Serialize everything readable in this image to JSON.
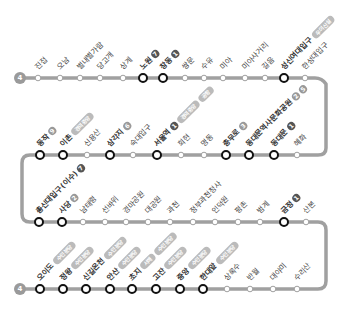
{
  "line": {
    "number": "4",
    "color": "#9a9a9a",
    "track_color": "#a0a0a0"
  },
  "rows": [
    {
      "y": 78,
      "stations": [
        {
          "name": "진접",
          "x": 38,
          "transfer": false
        },
        {
          "name": "오남",
          "x": 60,
          "transfer": false
        },
        {
          "name": "별내별가람",
          "x": 80,
          "transfer": false
        },
        {
          "name": "당고개",
          "x": 100,
          "transfer": false
        },
        {
          "name": "상계",
          "x": 123,
          "transfer": false
        },
        {
          "name": "노원",
          "x": 143,
          "transfer": true,
          "badges": [
            "7"
          ]
        },
        {
          "name": "창동",
          "x": 163,
          "transfer": true,
          "badges": [
            "1"
          ]
        },
        {
          "name": "쌍문",
          "x": 185,
          "transfer": false
        },
        {
          "name": "수유",
          "x": 204,
          "transfer": false
        },
        {
          "name": "미아",
          "x": 223,
          "transfer": false
        },
        {
          "name": "미아사거리",
          "x": 245,
          "transfer": false
        },
        {
          "name": "길음",
          "x": 265,
          "transfer": false
        },
        {
          "name": "성신여대입구",
          "x": 284,
          "transfer": true,
          "pills": [
            "우이신설"
          ]
        },
        {
          "name": "한성대입구",
          "x": 305,
          "transfer": false
        }
      ]
    },
    {
      "y": 155,
      "stations": [
        {
          "name": "혜화",
          "x": 297,
          "transfer": false
        },
        {
          "name": "동대문",
          "x": 274,
          "transfer": true,
          "badges": [
            "1"
          ]
        },
        {
          "name": "동대문역사문화공원",
          "x": 249,
          "transfer": true,
          "badges": [
            "2",
            "5"
          ]
        },
        {
          "name": "충무로",
          "x": 226,
          "transfer": true,
          "badges": [
            "3"
          ]
        },
        {
          "name": "명동",
          "x": 204,
          "transfer": false
        },
        {
          "name": "회현",
          "x": 181,
          "transfer": false
        },
        {
          "name": "서울역",
          "x": 157,
          "transfer": true,
          "badges": [
            "1"
          ],
          "pills": [
            "경의중앙",
            "공항"
          ]
        },
        {
          "name": "숙대입구",
          "x": 133,
          "transfer": false
        },
        {
          "name": "삼각지",
          "x": 110,
          "transfer": true,
          "badges": [
            "6"
          ]
        },
        {
          "name": "신용산",
          "x": 87,
          "transfer": false
        },
        {
          "name": "이촌",
          "x": 63,
          "transfer": true,
          "pills": [
            "경의중앙"
          ]
        },
        {
          "name": "동작",
          "x": 40,
          "transfer": true,
          "badges": [
            "9"
          ]
        }
      ]
    },
    {
      "y": 222,
      "stations": [
        {
          "name": "총신대입구(이수)",
          "x": 39,
          "transfer": true,
          "badges": [
            "7"
          ]
        },
        {
          "name": "사당",
          "x": 62,
          "transfer": true,
          "badges": [
            "2"
          ]
        },
        {
          "name": "남태령",
          "x": 83,
          "transfer": false
        },
        {
          "name": "선바위",
          "x": 105,
          "transfer": false
        },
        {
          "name": "경마공원",
          "x": 126,
          "transfer": false
        },
        {
          "name": "대공원",
          "x": 148,
          "transfer": false
        },
        {
          "name": "과천",
          "x": 170,
          "transfer": false
        },
        {
          "name": "정부과천청사",
          "x": 193,
          "transfer": false
        },
        {
          "name": "인덕원",
          "x": 215,
          "transfer": false
        },
        {
          "name": "평촌",
          "x": 238,
          "transfer": false
        },
        {
          "name": "범계",
          "x": 260,
          "transfer": false
        },
        {
          "name": "금정",
          "x": 284,
          "transfer": true,
          "badges": [
            "1"
          ]
        },
        {
          "name": "산본",
          "x": 306,
          "transfer": false
        }
      ]
    },
    {
      "y": 289,
      "stations": [
        {
          "name": "오이도",
          "x": 40,
          "transfer": true,
          "pills": [
            "수인분당"
          ]
        },
        {
          "name": "정왕",
          "x": 63,
          "transfer": true,
          "pills": [
            "수인분당"
          ]
        },
        {
          "name": "신길온천",
          "x": 86,
          "transfer": true,
          "pills": [
            "수인분당"
          ]
        },
        {
          "name": "안산",
          "x": 110,
          "transfer": true,
          "pills": [
            "수인분당"
          ]
        },
        {
          "name": "초지",
          "x": 132,
          "transfer": true,
          "pills": [
            "서해",
            "수인분당"
          ]
        },
        {
          "name": "고잔",
          "x": 156,
          "transfer": true,
          "pills": [
            "수인분당"
          ]
        },
        {
          "name": "중앙",
          "x": 180,
          "transfer": true,
          "pills": [
            "수인분당"
          ]
        },
        {
          "name": "한대앞",
          "x": 203,
          "transfer": true,
          "pills": [
            "수인분당"
          ]
        },
        {
          "name": "상록수",
          "x": 227,
          "transfer": false
        },
        {
          "name": "반월",
          "x": 250,
          "transfer": false
        },
        {
          "name": "대야미",
          "x": 273,
          "transfer": false
        },
        {
          "name": "수리산",
          "x": 297,
          "transfer": false
        }
      ]
    }
  ]
}
